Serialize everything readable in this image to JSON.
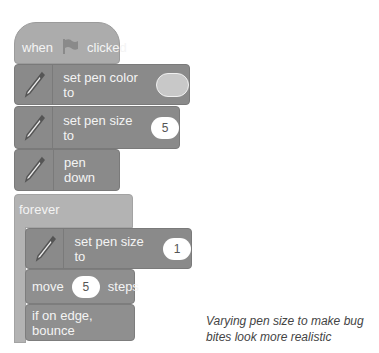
{
  "script": {
    "hat": {
      "prefix": "when",
      "icon": "green-flag-icon",
      "suffix": "clicked"
    },
    "set_pen_color": {
      "label": "set pen color to",
      "icon": "pen-icon"
    },
    "set_pen_size_1": {
      "label": "set pen size to",
      "value": "5",
      "icon": "pen-icon"
    },
    "pen_down": {
      "label": "pen down",
      "icon": "pen-icon"
    },
    "forever": {
      "label": "forever"
    },
    "set_pen_size_2": {
      "label": "set pen size to",
      "value": "1",
      "icon": "pen-icon"
    },
    "move": {
      "prefix": "move",
      "value": "5",
      "suffix": "steps"
    },
    "bounce": {
      "label": "if on edge, bounce"
    }
  },
  "caption": {
    "line1": "Varying pen size to make bug",
    "line2": "bites look more realistic"
  }
}
